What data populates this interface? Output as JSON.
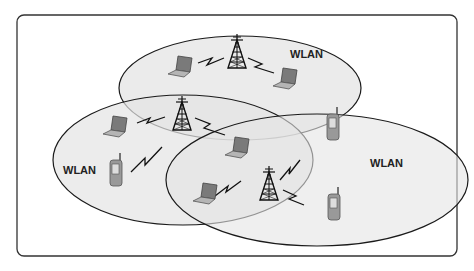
{
  "diagram": {
    "type": "wireless-network-overlap",
    "cells": [
      {
        "label": "WLAN",
        "position": "top"
      },
      {
        "label": "WLAN",
        "position": "left"
      },
      {
        "label": "WLAN",
        "position": "right"
      }
    ],
    "devices": {
      "towers": 3,
      "laptops": 5,
      "phones": 3
    },
    "colors": {
      "frame": "#333333",
      "ellipse_fill": "#e6e6e6",
      "ellipse_stroke": "#1a1a1a",
      "device_fill": "#8a8a8a"
    }
  }
}
